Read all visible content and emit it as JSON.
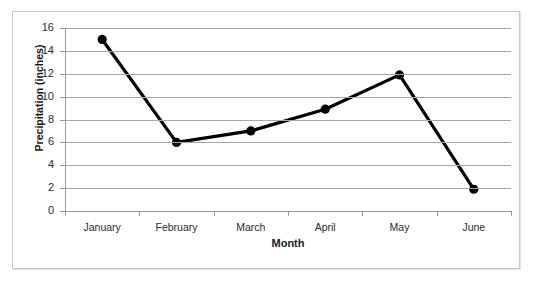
{
  "chart_data": {
    "type": "line",
    "title": "",
    "xlabel": "Month",
    "ylabel": "Precipitation (inches)",
    "categories": [
      "January",
      "February",
      "March",
      "April",
      "May",
      "June"
    ],
    "values": [
      15,
      6,
      7,
      8.9,
      11.9,
      1.9
    ],
    "series": [
      {
        "name": "Precipitation",
        "values": [
          15,
          6,
          7,
          8.9,
          11.9,
          1.9
        ]
      }
    ],
    "ylim": [
      0,
      16
    ],
    "ytick_step": 2,
    "yticks": [
      16,
      14,
      12,
      10,
      8,
      6,
      4,
      2,
      0
    ],
    "ytick_labels": [
      "16",
      "14",
      "12",
      "10",
      "8",
      "6",
      "4",
      "2",
      "0"
    ],
    "grid": "horizontal",
    "legend": "none",
    "marker": "circle",
    "line_color": "#000000",
    "marker_color": "#000000",
    "grid_color": "#a6a6a6",
    "axis_color": "#9a9a9a",
    "plot_background": "#ffffff"
  },
  "frame": {
    "border_color": "#c8c8c8",
    "background": "#ffffff"
  }
}
